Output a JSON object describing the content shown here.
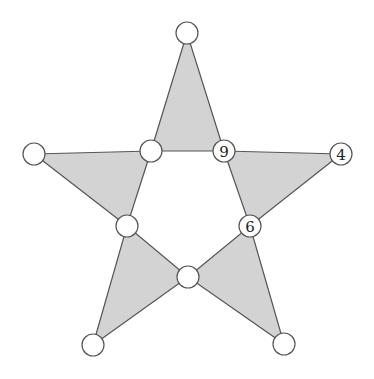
{
  "diagram": {
    "title": "",
    "type": "five-pointed star puzzle with circle nodes",
    "colors": {
      "triangle_fill": "#d3d3d3",
      "stroke": "#555555",
      "node_fill": "#ffffff"
    },
    "nodes": [
      {
        "id": "outer-top",
        "x": 187,
        "y": 33,
        "label": ""
      },
      {
        "id": "outer-left",
        "x": 34,
        "y": 154,
        "label": ""
      },
      {
        "id": "outer-right",
        "x": 341,
        "y": 154,
        "label": "4"
      },
      {
        "id": "outer-bottom-left",
        "x": 93,
        "y": 345,
        "label": ""
      },
      {
        "id": "outer-bottom-right",
        "x": 284,
        "y": 344,
        "label": ""
      },
      {
        "id": "inner-top-left",
        "x": 151,
        "y": 151,
        "label": ""
      },
      {
        "id": "inner-top-right",
        "x": 224,
        "y": 151,
        "label": "9"
      },
      {
        "id": "inner-right",
        "x": 250,
        "y": 226,
        "label": "6"
      },
      {
        "id": "inner-bottom",
        "x": 188,
        "y": 277,
        "label": ""
      },
      {
        "id": "inner-left",
        "x": 127,
        "y": 226,
        "label": ""
      }
    ]
  }
}
